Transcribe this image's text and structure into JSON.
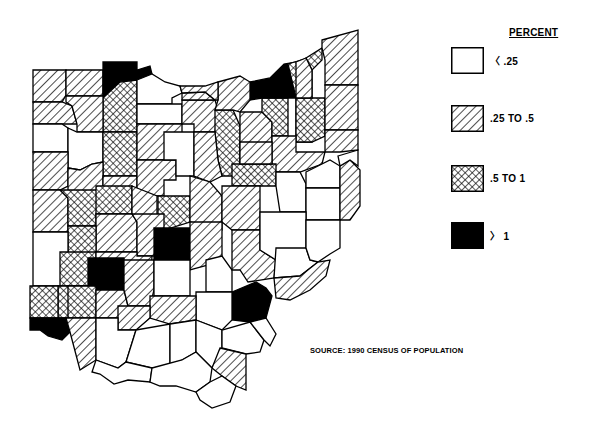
{
  "legend": {
    "title": "PERCENT",
    "items": [
      {
        "label": "〈 .25",
        "pattern": "none"
      },
      {
        "label": ".25 TO .5",
        "pattern": "hatch"
      },
      {
        "label": ".5 TO 1",
        "pattern": "cross"
      },
      {
        "label": "〉 1",
        "pattern": "solid"
      }
    ]
  },
  "source": "SOURCE: 1990 CENSUS OF POPULATION",
  "colors": {
    "ink": "#000000",
    "paper": "#ffffff"
  },
  "counties": [
    {
      "p": "h",
      "pts": "33,70 66,70 66,95 62,102 33,102"
    },
    {
      "p": "h",
      "pts": "66,70 103,70 103,96 66,96"
    },
    {
      "p": "s",
      "pts": "103,62 137,62 137,70 150,66 152,74 137,80 120,82 103,98"
    },
    {
      "p": "c",
      "pts": "103,98 120,82 137,80 137,132 103,132"
    },
    {
      "p": "n",
      "pts": "137,80 152,74 165,82 180,86 182,93 172,98 172,104 137,104"
    },
    {
      "p": "n",
      "pts": "137,104 172,104 182,104 182,124 137,124"
    },
    {
      "p": "h",
      "pts": "33,102 62,102 72,106 77,124 33,124"
    },
    {
      "p": "h",
      "pts": "66,96 103,96 103,132 77,132 77,124 72,106 66,102"
    },
    {
      "p": "n",
      "pts": "33,124 62,124 68,128 68,152 33,152"
    },
    {
      "p": "n",
      "pts": "68,128 77,132 103,132 103,162 92,164 80,170 68,168"
    },
    {
      "p": "c",
      "pts": "103,132 137,132 137,176 103,176"
    },
    {
      "p": "h",
      "pts": "137,124 182,124 182,154 176,154 176,160 137,160"
    },
    {
      "p": "h",
      "pts": "33,152 68,152 68,186 60,190 33,190"
    },
    {
      "p": "h",
      "pts": "68,168 80,170 92,164 103,162 103,198 68,198 68,186"
    },
    {
      "p": "h",
      "pts": "103,176 137,176 137,200 132,206 103,206"
    },
    {
      "p": "h",
      "pts": "137,160 176,160 176,180 164,180 164,196 137,196"
    },
    {
      "p": "n",
      "pts": "164,132 194,132 194,176 176,176 176,160 164,160"
    },
    {
      "p": "h",
      "pts": "182,100 215,100 218,110 215,132 194,132 194,124 182,124"
    },
    {
      "p": "h",
      "pts": "182,93 205,92 215,100 182,100"
    },
    {
      "p": "c",
      "pts": "215,110 233,110 240,126 240,176 222,176 218,160 215,132"
    },
    {
      "p": "h",
      "pts": "194,132 215,132 218,160 222,176 210,182 194,176"
    },
    {
      "p": "h",
      "pts": "240,112 262,112 272,122 272,164 240,164 240,126"
    },
    {
      "p": "c",
      "pts": "262,98 288,98 288,136 272,136 272,122 262,112"
    },
    {
      "p": "s",
      "pts": "250,82 270,78 284,64 296,62 296,98 288,98 262,98 250,100"
    },
    {
      "p": "h",
      "pts": "218,82 240,76 250,82 250,100 240,112 233,110 215,110 218,100"
    },
    {
      "p": "h",
      "pts": "180,86 205,86 218,82 218,100 215,100 205,92 182,93"
    },
    {
      "p": "c",
      "pts": "288,64 308,58 312,70 312,142 296,142 296,98"
    },
    {
      "p": "c",
      "pts": "296,98 325,98 325,136 312,142 296,142"
    },
    {
      "p": "c",
      "pts": "306,58 322,48 322,60 312,70"
    },
    {
      "p": "h",
      "pts": "296,62 306,58 312,70 312,98 296,98"
    },
    {
      "p": "h",
      "pts": "322,40 358,30 358,85 325,85 325,60 322,48"
    },
    {
      "p": "h",
      "pts": "325,85 358,85 358,130 325,130"
    },
    {
      "p": "h",
      "pts": "325,130 358,130 358,150 340,152 325,152"
    },
    {
      "p": "h",
      "pts": "272,136 296,136 296,152 325,152 322,164 300,172 276,172 272,164"
    },
    {
      "p": "c",
      "pts": "232,164 276,164 276,186 260,186 232,186"
    },
    {
      "p": "h",
      "pts": "240,142 272,142 272,164 240,164"
    },
    {
      "p": "n",
      "pts": "276,172 300,172 306,184 306,212 280,212 276,186"
    },
    {
      "p": "n",
      "pts": "306,172 330,160 340,166 340,188 306,188"
    },
    {
      "p": "n",
      "pts": "306,188 340,188 340,220 306,220"
    },
    {
      "p": "h",
      "pts": "340,166 350,160 360,170 360,206 350,220 340,220"
    },
    {
      "p": "n",
      "pts": "338,156 358,150 358,166 350,160 340,166"
    },
    {
      "p": "h",
      "pts": "33,190 60,190 68,198 68,232 33,232"
    },
    {
      "p": "c",
      "pts": "60,190 103,190 103,198 96,214 96,226 68,226 68,198"
    },
    {
      "p": "c",
      "pts": "96,186 132,186 132,214 96,214"
    },
    {
      "p": "h",
      "pts": "132,186 157,196 157,216 137,222 132,214"
    },
    {
      "p": "h",
      "pts": "96,214 132,214 137,222 137,252 96,252 96,226"
    },
    {
      "p": "c",
      "pts": "68,226 96,226 96,252 92,258 68,258"
    },
    {
      "p": "n",
      "pts": "33,232 68,232 68,286 33,286"
    },
    {
      "p": "c",
      "pts": "60,252 96,252 96,286 60,286"
    },
    {
      "p": "c",
      "pts": "158,196 190,196 190,222 164,230 158,230"
    },
    {
      "p": "h",
      "pts": "132,214 164,214 164,230 154,256 137,256 137,222"
    },
    {
      "p": "h",
      "pts": "190,176 210,182 222,196 222,230 190,222"
    },
    {
      "p": "h",
      "pts": "222,186 260,186 260,230 232,230 222,222"
    },
    {
      "p": "s",
      "pts": "154,228 190,228 190,260 154,260"
    },
    {
      "p": "h",
      "pts": "96,252 137,252 137,256 152,256 150,286 130,286 126,274 96,274"
    },
    {
      "p": "s",
      "pts": "88,258 124,258 124,290 88,290"
    },
    {
      "p": "c",
      "pts": "58,286 88,286 88,318 58,318"
    },
    {
      "p": "c",
      "pts": "30,286 58,286 58,318 30,318"
    },
    {
      "p": "c",
      "pts": "68,286 96,286 96,318 68,318"
    },
    {
      "p": "h",
      "pts": "96,290 124,290 128,306 118,318 96,318"
    },
    {
      "p": "h",
      "pts": "124,260 154,260 154,290 150,306 128,306 124,290"
    },
    {
      "p": "h",
      "pts": "190,222 222,222 222,256 212,264 190,270"
    },
    {
      "p": "n",
      "pts": "154,260 190,260 190,296 154,296"
    },
    {
      "p": "n",
      "pts": "206,260 222,256 232,270 232,292 206,292"
    },
    {
      "p": "h",
      "pts": "232,230 260,230 260,250 276,260 274,278 248,282 240,270 232,270"
    },
    {
      "p": "n",
      "pts": "260,212 306,212 306,248 276,260 260,250"
    },
    {
      "p": "n",
      "pts": "276,248 306,248 310,260 318,262 300,276 274,278"
    },
    {
      "p": "n",
      "pts": "306,220 340,220 340,248 330,254 318,262 310,260 306,248"
    },
    {
      "p": "h",
      "pts": "274,278 300,276 318,262 330,260 326,276 310,290 290,300 276,298"
    },
    {
      "p": "s",
      "pts": "232,292 256,282 266,288 272,296 266,318 250,322 232,320"
    },
    {
      "p": "n",
      "pts": "196,292 232,292 232,320 222,330 196,320"
    },
    {
      "p": "h",
      "pts": "150,296 196,296 196,320 170,324 150,318"
    },
    {
      "p": "h",
      "pts": "118,306 150,306 150,318 136,330 118,330"
    },
    {
      "p": "s",
      "pts": "30,318 66,318 70,332 62,340 48,336 40,330 30,330"
    },
    {
      "p": "h",
      "pts": "66,318 96,318 96,360 80,370 70,332"
    },
    {
      "p": "n",
      "pts": "96,318 118,318 118,330 136,330 126,362 118,368 96,360"
    },
    {
      "p": "n",
      "pts": "136,330 170,324 170,366 152,368 126,362"
    },
    {
      "p": "n",
      "pts": "170,324 196,320 196,352 182,360 170,366"
    },
    {
      "p": "n",
      "pts": "196,320 222,330 222,348 212,368 196,352"
    },
    {
      "p": "n",
      "pts": "222,330 250,322 264,340 260,352 246,354 222,348"
    },
    {
      "p": "h",
      "pts": "220,348 246,354 246,390 236,386 222,376 212,368"
    },
    {
      "p": "n",
      "pts": "250,322 266,318 276,334 270,346 264,340"
    },
    {
      "p": "n",
      "pts": "96,360 118,368 126,362 152,368 150,382 128,380 114,384 100,374 92,372"
    },
    {
      "p": "n",
      "pts": "152,368 182,360 196,352 212,368 210,382 196,392 176,386 160,386 150,382"
    },
    {
      "p": "n",
      "pts": "196,392 210,382 222,376 236,386 230,402 212,408 200,400"
    }
  ]
}
